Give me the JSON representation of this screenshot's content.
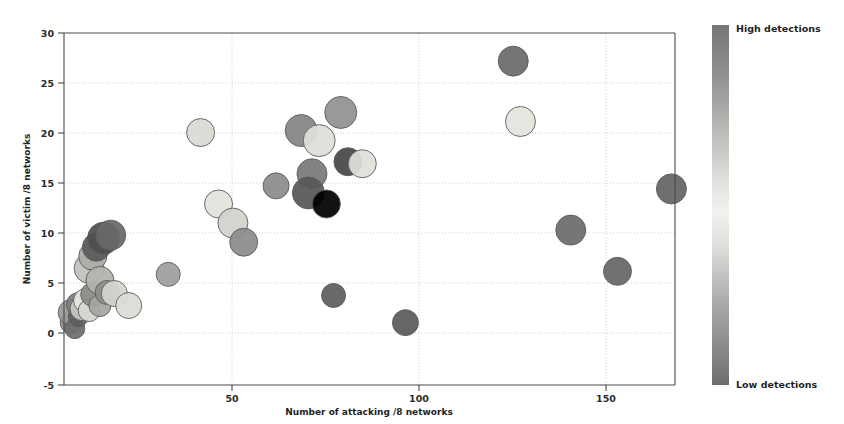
{
  "figure": {
    "background_color": "#ffffff",
    "width": 844,
    "height": 424
  },
  "axes": {
    "x_title": "Number of attacking /8 networks",
    "y_title": "Number of victim /8 networks",
    "x_ticks": [
      "50",
      "100",
      "150"
    ],
    "y_ticks": [
      "30",
      "25",
      "20",
      "15",
      "10",
      "5",
      "0",
      "-5"
    ]
  },
  "colorbar": {
    "high_label": "High detections",
    "low_label": "Low detections",
    "top_color": "#767676",
    "mid_color": "#f2f2ee",
    "bottom_color": "#6e6e6e"
  },
  "chart_data": {
    "type": "scatter",
    "title": "",
    "xlabel": "Number of attacking /8 networks",
    "ylabel": "Number of victim /8 networks",
    "xlim": [
      5,
      175
    ],
    "ylim": [
      -5,
      30
    ],
    "xticks": [
      50,
      100,
      150
    ],
    "yticks": [
      -5,
      0,
      5,
      10,
      15,
      20,
      25,
      30
    ],
    "grid": true,
    "legend": "colorbar-right",
    "colormap": "gray-detections",
    "size_encoding": "bubble-radius",
    "color_encoding": "detections",
    "points": [
      {
        "x": 7,
        "y": 1.2,
        "r": 11,
        "color": "#8f8f8f"
      },
      {
        "x": 7,
        "y": 2.2,
        "r": 13,
        "color": "#9a9a9a"
      },
      {
        "x": 8,
        "y": 0.6,
        "r": 10,
        "color": "#6e6e6e"
      },
      {
        "x": 9,
        "y": 3.0,
        "r": 12,
        "color": "#7d7d7d"
      },
      {
        "x": 9,
        "y": 1.8,
        "r": 10,
        "color": "#5f5f5f"
      },
      {
        "x": 10,
        "y": 2.6,
        "r": 12,
        "color": "#c9c9c4"
      },
      {
        "x": 11,
        "y": 3.4,
        "r": 12,
        "color": "#e6e6e0"
      },
      {
        "x": 12,
        "y": 2.4,
        "r": 11,
        "color": "#d8d8d2"
      },
      {
        "x": 12,
        "y": 6.6,
        "r": 15,
        "color": "#c2c2bc"
      },
      {
        "x": 13,
        "y": 4.0,
        "r": 12,
        "color": "#8a8a8a"
      },
      {
        "x": 13,
        "y": 7.8,
        "r": 14,
        "color": "#adada8"
      },
      {
        "x": 14,
        "y": 8.7,
        "r": 14,
        "color": "#5a5a5a"
      },
      {
        "x": 15,
        "y": 5.4,
        "r": 14,
        "color": "#b4b4ae"
      },
      {
        "x": 15,
        "y": 2.9,
        "r": 11,
        "color": "#a5a5a0"
      },
      {
        "x": 16,
        "y": 9.6,
        "r": 16,
        "color": "#4f4f4f"
      },
      {
        "x": 17,
        "y": 4.2,
        "r": 12,
        "color": "#8d8d8d"
      },
      {
        "x": 18,
        "y": 9.9,
        "r": 15,
        "color": "#686868"
      },
      {
        "x": 19,
        "y": 4.1,
        "r": 13,
        "color": "#d5d5cf"
      },
      {
        "x": 23,
        "y": 2.9,
        "r": 13,
        "color": "#dcdcd6"
      },
      {
        "x": 34,
        "y": 6.0,
        "r": 12,
        "color": "#9e9e9e"
      },
      {
        "x": 43,
        "y": 20.1,
        "r": 14,
        "color": "#dadad4"
      },
      {
        "x": 48,
        "y": 13.0,
        "r": 14,
        "color": "#e3e3dd"
      },
      {
        "x": 52,
        "y": 11.1,
        "r": 15,
        "color": "#d3d3cd"
      },
      {
        "x": 55,
        "y": 9.2,
        "r": 14,
        "color": "#8c8c8c"
      },
      {
        "x": 64,
        "y": 14.8,
        "r": 13,
        "color": "#8b8b8b"
      },
      {
        "x": 71,
        "y": 20.3,
        "r": 16,
        "color": "#848484"
      },
      {
        "x": 76,
        "y": 19.3,
        "r": 16,
        "color": "#dededa"
      },
      {
        "x": 74,
        "y": 16.0,
        "r": 15,
        "color": "#7a7a7a"
      },
      {
        "x": 73,
        "y": 14.1,
        "r": 16,
        "color": "#575757"
      },
      {
        "x": 78,
        "y": 13.0,
        "r": 14,
        "color": "#ececе6"
      },
      {
        "x": 82,
        "y": 22.1,
        "r": 16,
        "color": "#919191"
      },
      {
        "x": 84,
        "y": 17.2,
        "r": 14,
        "color": "#474747"
      },
      {
        "x": 88,
        "y": 17.0,
        "r": 14,
        "color": "#e0e0da"
      },
      {
        "x": 80,
        "y": 3.9,
        "r": 12,
        "color": "#5e5e5e"
      },
      {
        "x": 100,
        "y": 1.2,
        "r": 13,
        "color": "#5a5a5a"
      },
      {
        "x": 130,
        "y": 27.2,
        "r": 15,
        "color": "#6a6a6a"
      },
      {
        "x": 132,
        "y": 21.2,
        "r": 15,
        "color": "#e4e4de"
      },
      {
        "x": 146,
        "y": 10.4,
        "r": 15,
        "color": "#6c6c6c"
      },
      {
        "x": 159,
        "y": 6.3,
        "r": 14,
        "color": "#666666"
      },
      {
        "x": 174,
        "y": 14.5,
        "r": 15,
        "color": "#646464"
      }
    ]
  }
}
